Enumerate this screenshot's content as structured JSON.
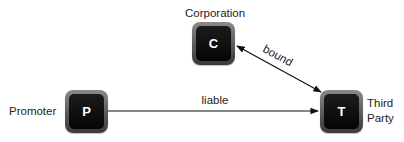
{
  "diagram": {
    "nodes": [
      {
        "id": "C",
        "letter": "C",
        "label": "Corporation"
      },
      {
        "id": "P",
        "letter": "P",
        "label": "Promoter"
      },
      {
        "id": "T",
        "letter": "T",
        "label_line1": "Third",
        "label_line2": "Party"
      }
    ],
    "edges": [
      {
        "from": "P",
        "to": "T",
        "label": "liable",
        "direction": "one-way"
      },
      {
        "from": "C",
        "to": "T",
        "label": "bound",
        "direction": "two-way"
      }
    ]
  },
  "colors": {
    "node_outer": "#5e5e5e",
    "node_inner": "#0a0a0a",
    "node_text": "#ffffff",
    "line": "#111111",
    "text": "#222222"
  }
}
